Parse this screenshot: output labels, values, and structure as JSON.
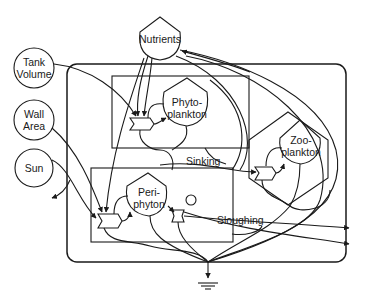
{
  "diagram": {
    "type": "energy systems / aquarium ecosystem model",
    "nodes": {
      "nutrients": {
        "label": "Nutrients",
        "shape": "storage-tank"
      },
      "tank_volume": {
        "label": "Tank\nVolume",
        "shape": "source-circle"
      },
      "wall_area": {
        "label": "Wall\nArea",
        "shape": "source-circle"
      },
      "sun": {
        "label": "Sun",
        "shape": "source-circle"
      },
      "phytoplankton": {
        "label": "Phyto-\nplankton",
        "shape": "producer"
      },
      "zooplankton": {
        "label": "Zoo-\nplankton",
        "shape": "consumer-hexagon"
      },
      "periphyton": {
        "label": "Peri-\nphyton",
        "shape": "producer"
      }
    },
    "flows": {
      "sinking": "Sinking",
      "sloughing": "Sloughing"
    },
    "sinks": {
      "heat": "heat-sink-ground"
    },
    "colors": {
      "line": "#1a1a1a",
      "background": "#ffffff"
    }
  }
}
